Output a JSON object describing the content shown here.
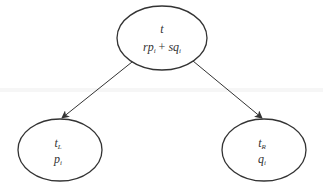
{
  "diagram": {
    "type": "tree",
    "colors": {
      "background": "#ffffff",
      "stroke": "#333333",
      "text": "#333333"
    },
    "nodes": [
      {
        "id": "root",
        "label_main": "t",
        "label_main_sub": "",
        "label_expr": {
          "a": "rp",
          "a_sub": "i",
          "op": " + ",
          "b": "sq",
          "b_sub": "i"
        },
        "cx": 162,
        "cy": 38,
        "rx": 45,
        "ry": 32
      },
      {
        "id": "left",
        "label_main": "t",
        "label_main_sub": "L",
        "label_second": "p",
        "label_second_sub": "i",
        "cx": 60,
        "cy": 150,
        "rx": 42,
        "ry": 31
      },
      {
        "id": "right",
        "label_main": "t",
        "label_main_sub": "R",
        "label_second": "q",
        "label_second_sub": "i",
        "cx": 264,
        "cy": 150,
        "rx": 42,
        "ry": 31
      }
    ],
    "edges": [
      {
        "from": "root",
        "to": "left",
        "x1": 132,
        "y1": 62,
        "x2": 62,
        "y2": 118
      },
      {
        "from": "root",
        "to": "right",
        "x1": 193,
        "y1": 61,
        "x2": 262,
        "y2": 118
      }
    ]
  }
}
